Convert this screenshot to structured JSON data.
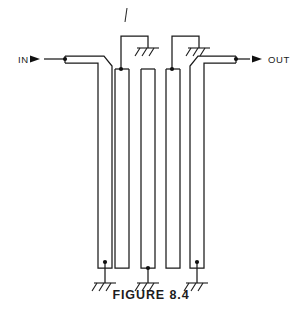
{
  "figure": {
    "caption": "FIGURE 8.4",
    "background_color": "#ffffff",
    "line_color": "#1a1a1a",
    "width": 302,
    "height": 312
  },
  "ports": [
    {
      "id": "in",
      "label": "IN",
      "label_x": 18,
      "label_y": 62,
      "arrow_x1": 32,
      "arrow_x2": 44,
      "arrow_y": 59,
      "lead_x1": 44,
      "lead_x2": 65,
      "node_x": 65,
      "node_y": 59,
      "direction": "right"
    },
    {
      "id": "out",
      "label": "OUT",
      "label_x": 268,
      "label_y": 62,
      "arrow_x1": 248,
      "arrow_x2": 262,
      "arrow_y": 59,
      "lead_x1": 236,
      "lead_x2": 248,
      "node_x": 236,
      "node_y": 59,
      "direction": "right"
    }
  ],
  "fingers": [
    {
      "index": 1,
      "name": "resonator-finger-1",
      "orientation": "open-top-grounded-bottom",
      "left_x": 86,
      "right_x": 98,
      "top_y": 59,
      "bottom_y": 262,
      "grounded_end": "bottom",
      "ground_symbol": "ground-bottom-1"
    },
    {
      "index": 2,
      "name": "resonator-finger-2",
      "orientation": "grounded-top-open-bottom",
      "left_x": 115,
      "right_x": 127,
      "top_y": 69,
      "bottom_y": 268,
      "grounded_end": "top",
      "ground_symbol": "ground-top-1"
    },
    {
      "index": 3,
      "name": "resonator-finger-3",
      "orientation": "open-top-grounded-bottom",
      "left_x": 141,
      "right_x": 153,
      "top_y": 69,
      "bottom_y": 262,
      "grounded_end": "bottom",
      "ground_symbol": "ground-bottom-2"
    },
    {
      "index": 4,
      "name": "resonator-finger-4",
      "orientation": "grounded-top-open-bottom",
      "left_x": 166,
      "right_x": 178,
      "top_y": 69,
      "bottom_y": 268,
      "grounded_end": "top",
      "ground_symbol": "ground-top-2"
    },
    {
      "index": 5,
      "name": "resonator-finger-5",
      "orientation": "open-top-grounded-bottom",
      "left_x": 192,
      "right_x": 204,
      "top_y": 59,
      "bottom_y": 262,
      "grounded_end": "bottom",
      "ground_symbol": "ground-bottom-3"
    }
  ],
  "grounds": [
    {
      "id": "ground-top-1",
      "name": "ground-symbol-top-1",
      "stem_x": 121,
      "stem_y1": 69,
      "stem_y2": 36,
      "bar_x1": 121,
      "bar_x2": 148,
      "bar_y": 36,
      "drop_x": 148,
      "drop_y1": 36,
      "drop_y2": 48,
      "sym_x": 148,
      "sym_y": 48,
      "position": "top"
    },
    {
      "id": "ground-top-2",
      "name": "ground-symbol-top-2",
      "stem_x": 172,
      "stem_y1": 69,
      "stem_y2": 36,
      "bar_x1": 172,
      "bar_x2": 199,
      "bar_y": 36,
      "drop_x": 199,
      "drop_y1": 36,
      "drop_y2": 48,
      "sym_x": 199,
      "sym_y": 48,
      "position": "top"
    },
    {
      "id": "ground-bottom-1",
      "name": "ground-symbol-bottom-1",
      "stem_x": 92,
      "stem_y1": 262,
      "stem_y2": 283,
      "sym_x": 92,
      "sym_y": 283,
      "position": "bottom"
    },
    {
      "id": "ground-bottom-2",
      "name": "ground-symbol-bottom-2",
      "stem_x": 147,
      "stem_y1": 262,
      "stem_y2": 283,
      "sym_x": 147,
      "sym_y": 283,
      "position": "bottom"
    },
    {
      "id": "ground-bottom-3",
      "name": "ground-symbol-bottom-3",
      "stem_x": 198,
      "stem_y1": 262,
      "stem_y2": 283,
      "sym_x": 198,
      "sym_y": 283,
      "position": "bottom"
    }
  ],
  "stray_mark": {
    "name": "stray-pen-mark",
    "x1": 127,
    "y1": 8,
    "x2": 125,
    "y2": 22
  }
}
